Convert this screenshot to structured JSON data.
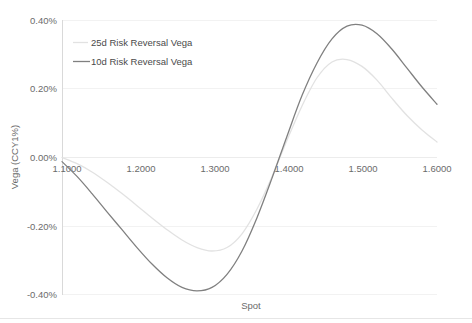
{
  "chart_data": {
    "type": "line",
    "title": "",
    "xlabel": "Spot",
    "ylabel": "Vega (CCY1%)",
    "xlim": [
      1.1,
      1.6
    ],
    "ylim": [
      -0.4,
      0.4
    ],
    "grid": true,
    "legend_position": "top-left-inside",
    "x_tick_labels": [
      "1.1000",
      "1.2000",
      "1.3000",
      "1.4000",
      "1.5000",
      "1.6000"
    ],
    "x_ticks": [
      1.1,
      1.2,
      1.3,
      1.4,
      1.5,
      1.6
    ],
    "y_tick_labels": [
      "0.40%",
      "0.20%",
      "0.00%",
      "-0.20%",
      "-0.40%"
    ],
    "y_ticks": [
      0.4,
      0.2,
      0.0,
      -0.2,
      -0.4
    ],
    "x": [
      1.1,
      1.12,
      1.14,
      1.16,
      1.18,
      1.2,
      1.22,
      1.24,
      1.26,
      1.28,
      1.3,
      1.32,
      1.34,
      1.36,
      1.38,
      1.4,
      1.42,
      1.44,
      1.46,
      1.48,
      1.5,
      1.52,
      1.54,
      1.56,
      1.58,
      1.6
    ],
    "series": [
      {
        "name": "25d Risk Reversal Vega",
        "color": "#e2e2e2",
        "values": [
          0.0,
          -0.018,
          -0.042,
          -0.072,
          -0.105,
          -0.14,
          -0.176,
          -0.21,
          -0.24,
          -0.262,
          -0.272,
          -0.262,
          -0.222,
          -0.15,
          -0.056,
          0.05,
          0.15,
          0.232,
          0.278,
          0.285,
          0.265,
          0.225,
          0.172,
          0.122,
          0.08,
          0.045
        ]
      },
      {
        "name": "10d Risk Reversal Vega",
        "color": "#808080",
        "values": [
          -0.012,
          -0.055,
          -0.105,
          -0.158,
          -0.21,
          -0.262,
          -0.31,
          -0.35,
          -0.378,
          -0.388,
          -0.378,
          -0.34,
          -0.272,
          -0.175,
          -0.06,
          0.062,
          0.18,
          0.275,
          0.345,
          0.382,
          0.385,
          0.36,
          0.315,
          0.26,
          0.205,
          0.155
        ]
      }
    ],
    "legend": [
      {
        "label": "25d Risk Reversal Vega",
        "color": "#e2e2e2"
      },
      {
        "label": "10d Risk Reversal Vega",
        "color": "#808080"
      }
    ]
  },
  "colors": {
    "series_25d": "#e2e2e2",
    "series_10d": "#808080",
    "gridline": "#f2f2f2",
    "axis": "#d9d9d9",
    "text": "#6b6b6b",
    "background": "#ffffff"
  }
}
